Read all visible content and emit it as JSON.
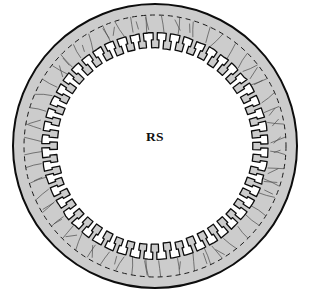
{
  "figure": {
    "name": "toothed-ring-cross-section",
    "center_label": "RS",
    "background_color": "#ffffff"
  },
  "geometry": {
    "center_x": 155,
    "center_y": 146,
    "outer_radius": 143,
    "dashed_radius": 131,
    "tooth_root_radius": 113,
    "tooth_tip_radius": 98,
    "tooth_count": 52,
    "hatch_line_count": 52
  },
  "style": {
    "fill_color": "#cccccc",
    "outline_color": "#0d0d0d",
    "dashed_color": "#1a1a1a",
    "hatch_color": "#4a4a4a",
    "label_color": "#101010",
    "outer_stroke_width": 2.0,
    "tooth_stroke_width": 1.3,
    "dashed_stroke_width": 1.0,
    "hatch_stroke_width": 0.7,
    "dash_pattern": "5 4"
  },
  "elements": {
    "outer_circle_name": "outer-rim-circle",
    "dashed_circle_name": "inner-dashed-circle",
    "toothed_boundary_name": "toothed-inner-boundary",
    "hatching_name": "radial-hatching",
    "label_name": "center-label-rs"
  },
  "chart_data": {
    "type": "diagram",
    "title": "RS",
    "shape": "annulus-with-internal-teeth",
    "radii": {
      "outer": 143,
      "dashed_guide": 131,
      "tooth_root": 113,
      "tooth_tip": 98
    },
    "tooth_count": 52,
    "annotations": [
      "RS"
    ]
  }
}
